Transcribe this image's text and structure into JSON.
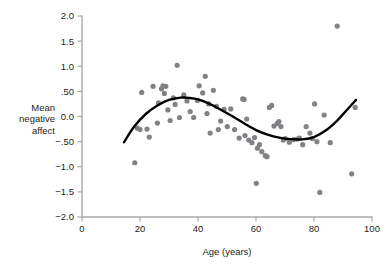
{
  "chart_data": {
    "type": "scatter",
    "title": "",
    "xlabel": "Age (years)",
    "ylabel": "Mean negative affect",
    "ylabel_lines": [
      "Mean",
      "negative",
      "affect"
    ],
    "xlim": [
      0,
      100
    ],
    "ylim": [
      -2.0,
      2.0
    ],
    "xticks": [
      0,
      20,
      40,
      60,
      80,
      100
    ],
    "xticklabels": [
      "0",
      "20",
      "40",
      "60",
      "80",
      "100"
    ],
    "yticks": [
      2.0,
      1.5,
      1.0,
      0.5,
      0.0,
      -0.5,
      -1.0,
      -1.5,
      -2.0
    ],
    "yticklabels": [
      "2.0",
      "1.5",
      "1.0",
      ".50",
      "0.0",
      "−.50",
      "−1.0",
      "−1.5",
      "−2.0"
    ],
    "grid": false,
    "legend": null,
    "point_color": "#808285",
    "curve_color": "#000000",
    "axis_color": "#a7a9ac",
    "point_radius": 2.6,
    "points": [
      [
        18.2,
        -0.92
      ],
      [
        19.0,
        -0.23
      ],
      [
        20.0,
        -0.26
      ],
      [
        20.6,
        0.48
      ],
      [
        22.4,
        -0.25
      ],
      [
        23.2,
        -0.41
      ],
      [
        24.5,
        0.6
      ],
      [
        26.0,
        -0.13
      ],
      [
        26.4,
        0.27
      ],
      [
        27.4,
        0.55
      ],
      [
        27.9,
        0.61
      ],
      [
        28.4,
        0.46
      ],
      [
        28.9,
        0.6
      ],
      [
        29.6,
        0.13
      ],
      [
        30.4,
        -0.08
      ],
      [
        31.5,
        0.37
      ],
      [
        32.1,
        0.24
      ],
      [
        32.8,
        1.02
      ],
      [
        33.6,
        -0.02
      ],
      [
        35.1,
        0.43
      ],
      [
        36.2,
        0.31
      ],
      [
        37.3,
        0.1
      ],
      [
        38.5,
        -0.02
      ],
      [
        39.8,
        0.32
      ],
      [
        40.4,
        0.61
      ],
      [
        41.6,
        0.47
      ],
      [
        42.5,
        0.8
      ],
      [
        43.1,
        0.06
      ],
      [
        43.7,
        0.25
      ],
      [
        44.2,
        -0.33
      ],
      [
        45.3,
        0.52
      ],
      [
        46.4,
        0.2
      ],
      [
        47.0,
        -0.26
      ],
      [
        47.8,
        -0.09
      ],
      [
        49.0,
        0.14
      ],
      [
        50.1,
        -0.2
      ],
      [
        51.3,
        0.15
      ],
      [
        52.6,
        -0.26
      ],
      [
        54.2,
        -0.43
      ],
      [
        55.4,
        0.35
      ],
      [
        55.9,
        0.34
      ],
      [
        56.2,
        -0.38
      ],
      [
        56.8,
        -0.05
      ],
      [
        57.5,
        -0.47
      ],
      [
        58.6,
        -0.52
      ],
      [
        59.5,
        -0.42
      ],
      [
        60.1,
        -1.33
      ],
      [
        60.5,
        -0.63
      ],
      [
        61.2,
        -0.56
      ],
      [
        62.0,
        -0.7
      ],
      [
        63.2,
        -0.78
      ],
      [
        63.8,
        -0.8
      ],
      [
        64.6,
        0.18
      ],
      [
        65.4,
        0.22
      ],
      [
        66.2,
        -0.19
      ],
      [
        67.3,
        -0.14
      ],
      [
        67.9,
        -0.1
      ],
      [
        68.6,
        -0.2
      ],
      [
        69.4,
        -0.47
      ],
      [
        70.1,
        -0.44
      ],
      [
        71.5,
        -0.51
      ],
      [
        73.0,
        -0.46
      ],
      [
        74.2,
        -0.45
      ],
      [
        75.0,
        -0.43
      ],
      [
        76.1,
        -0.56
      ],
      [
        77.3,
        -0.2
      ],
      [
        78.6,
        -0.33
      ],
      [
        79.4,
        -0.44
      ],
      [
        80.2,
        0.25
      ],
      [
        81.0,
        -0.5
      ],
      [
        82.0,
        -1.51
      ],
      [
        83.5,
        0.03
      ],
      [
        85.6,
        -0.52
      ],
      [
        88.0,
        1.8
      ],
      [
        93.0,
        -1.14
      ],
      [
        94.2,
        0.18
      ]
    ],
    "fit_curve": {
      "label": "smoothed fit",
      "x": [
        14.5,
        18,
        22,
        26,
        30,
        34,
        37,
        40,
        44,
        48,
        52,
        56,
        60,
        64,
        68,
        72,
        76,
        80,
        84,
        88,
        91,
        94.5
      ],
      "y": [
        -0.51,
        -0.2,
        0.05,
        0.22,
        0.33,
        0.375,
        0.37,
        0.34,
        0.25,
        0.13,
        0.0,
        -0.14,
        -0.27,
        -0.36,
        -0.42,
        -0.45,
        -0.455,
        -0.41,
        -0.28,
        -0.08,
        0.11,
        0.33
      ]
    }
  }
}
